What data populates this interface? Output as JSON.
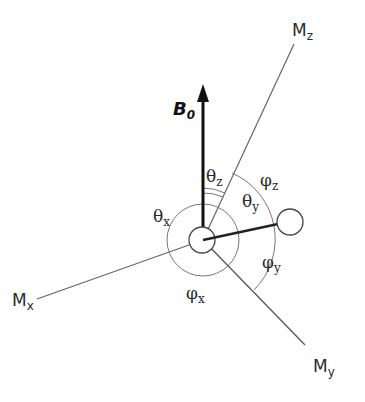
{
  "diagram": {
    "type": "vector-angle-diagram",
    "field": {
      "label": "B",
      "subscript": "0"
    },
    "axes": [
      {
        "id": "Mx",
        "label": "M",
        "subscript": "x"
      },
      {
        "id": "My",
        "label": "M",
        "subscript": "y"
      },
      {
        "id": "Mz",
        "label": "M",
        "subscript": "z"
      }
    ],
    "angles": {
      "theta_x": {
        "symbol": "θ",
        "subscript": "x"
      },
      "theta_y": {
        "symbol": "θ",
        "subscript": "y"
      },
      "theta_z": {
        "symbol": "θ",
        "subscript": "z"
      },
      "phi_x": {
        "symbol": "φ",
        "subscript": "x"
      },
      "phi_y": {
        "symbol": "φ",
        "subscript": "y"
      },
      "phi_z": {
        "symbol": "φ",
        "subscript": "z"
      }
    },
    "colors": {
      "line": "#555555",
      "arrow": "#111111",
      "background": "#ffffff"
    }
  }
}
